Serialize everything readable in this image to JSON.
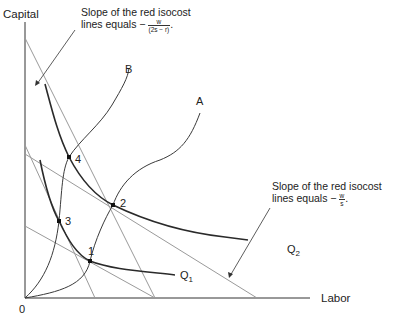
{
  "axes": {
    "y_label": "Capital",
    "x_label": "Labor",
    "origin_label": "0"
  },
  "curves": {
    "expansion_path_a": "A",
    "expansion_path_b": "B",
    "isoquant_1": {
      "base": "Q",
      "sub": "1"
    },
    "isoquant_2": {
      "base": "Q",
      "sub": "2"
    }
  },
  "points": [
    "1",
    "2",
    "3",
    "4"
  ],
  "annotations": {
    "top_note": {
      "line1": "Slope of the red isocost",
      "line2": "lines equals −",
      "frac_num": "w",
      "frac_den": "(2s − r)",
      "suffix": "."
    },
    "right_note": {
      "line1": "Slope of the red isocost",
      "line2": "lines equals −",
      "frac_num": "w",
      "frac_den": "s",
      "suffix": "."
    }
  },
  "colors": {
    "axis": "#333333",
    "isoquant": "#2a2a2a",
    "isocost": "#9a9a9a",
    "path": "#3a3a3a",
    "point": "#111111"
  }
}
